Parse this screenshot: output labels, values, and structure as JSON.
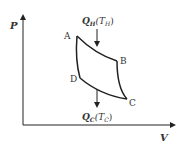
{
  "diagram": {
    "axes": {
      "y_label": "P",
      "x_label": "V"
    },
    "points": {
      "A": "A",
      "B": "B",
      "C": "C",
      "D": "D"
    },
    "heat_in": {
      "symbol": "Q",
      "sub": "H",
      "temp_open": "(T",
      "temp_sub": "H",
      "temp_close": ")"
    },
    "heat_out": {
      "symbol": "Q",
      "sub": "C",
      "temp_open": "(T",
      "temp_sub": "C",
      "temp_close": ")"
    },
    "colors": {
      "stroke": "#222222",
      "text": "#333333"
    }
  }
}
